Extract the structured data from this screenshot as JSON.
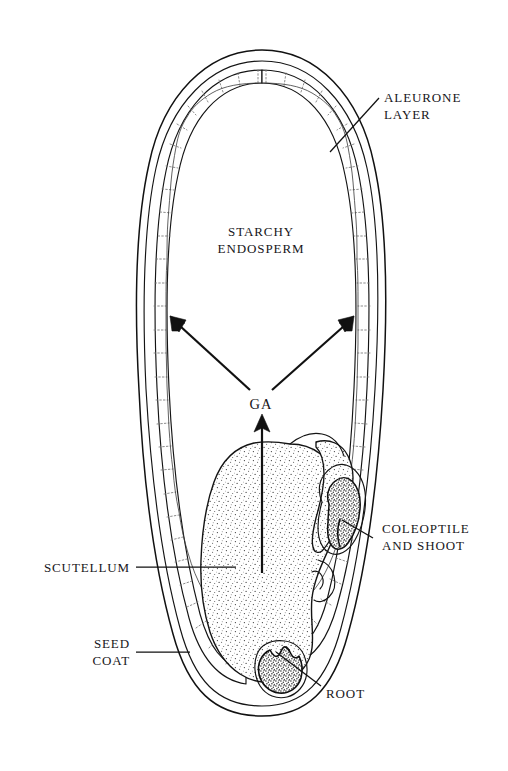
{
  "figure": {
    "background_color": "#ffffff",
    "ink_color": "#111111",
    "width": 508,
    "height": 771
  },
  "labels": {
    "aleurone": {
      "line1": "ALEURONE",
      "line2": "LAYER"
    },
    "starchy_endosperm": {
      "line1": "STARCHY",
      "line2": "ENDOSPERM"
    },
    "ga": {
      "line1": "GA"
    },
    "coleoptile": {
      "line1": "COLEOPTILE",
      "line2": "AND SHOOT"
    },
    "scutellum": {
      "line1": "SCUTELLUM"
    },
    "seed_coat": {
      "line1": "SEED",
      "line2": "COAT"
    },
    "root": {
      "line1": "ROOT"
    }
  },
  "parts": [
    {
      "id": "aleurone-layer",
      "name": "Aleurone layer",
      "label": "ALEURONE LAYER",
      "leader": true,
      "side": "right"
    },
    {
      "id": "starchy-endosperm",
      "name": "Starchy endosperm",
      "label": "STARCHY ENDOSPERM",
      "leader": false,
      "side": "center"
    },
    {
      "id": "ga",
      "name": "Gibberellic acid",
      "label": "GA",
      "leader": false,
      "side": "center"
    },
    {
      "id": "coleoptile-shoot",
      "name": "Coleoptile and shoot",
      "label": "COLEOPTILE AND SHOOT",
      "leader": true,
      "side": "right"
    },
    {
      "id": "scutellum",
      "name": "Scutellum",
      "label": "SCUTELLUM",
      "leader": true,
      "side": "left"
    },
    {
      "id": "seed-coat",
      "name": "Seed coat",
      "label": "SEED COAT",
      "leader": true,
      "side": "left"
    },
    {
      "id": "root",
      "name": "Root",
      "label": "ROOT",
      "leader": true,
      "side": "right"
    }
  ],
  "arrows": [
    {
      "id": "ga-to-left-aleurone",
      "from": "GA",
      "to": "aleurone layer (left)"
    },
    {
      "id": "ga-to-right-aleurone",
      "from": "GA",
      "to": "aleurone layer (right)"
    },
    {
      "id": "scutellum-to-ga",
      "from": "scutellum",
      "to": "GA"
    }
  ]
}
